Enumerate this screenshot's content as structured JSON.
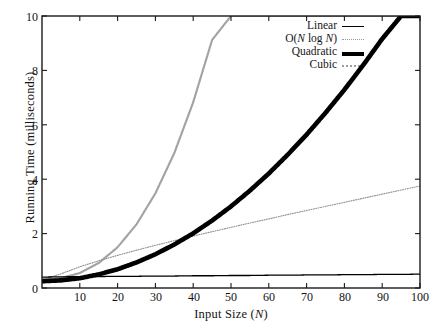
{
  "chart_data": {
    "type": "line",
    "title": "",
    "xlabel": "Input Size (N)",
    "ylabel": "Running Time (milliseconds)",
    "xlim": [
      0,
      100
    ],
    "ylim": [
      0,
      10
    ],
    "grid": false,
    "legend_position": "top-right",
    "xticks": [
      10,
      20,
      30,
      40,
      50,
      60,
      70,
      80,
      90,
      100
    ],
    "yticks": [
      0,
      2,
      4,
      6,
      8,
      10
    ],
    "x": [
      0,
      5,
      10,
      15,
      20,
      25,
      30,
      35,
      40,
      45,
      50,
      55,
      60,
      65,
      70,
      75,
      80,
      85,
      90,
      95,
      100
    ],
    "series": [
      {
        "name": "Linear",
        "legend_label": "Linear",
        "style": "thin-solid-black",
        "color": "#000000",
        "values": [
          0.4,
          0.41,
          0.42,
          0.42,
          0.43,
          0.43,
          0.44,
          0.44,
          0.45,
          0.45,
          0.46,
          0.46,
          0.47,
          0.47,
          0.48,
          0.48,
          0.49,
          0.49,
          0.5,
          0.5,
          0.51
        ]
      },
      {
        "name": "O(N log N)",
        "legend_label": "O(N log N)",
        "style": "fine-dotted-gray",
        "color": "#8c8c8c",
        "values": [
          0.3,
          0.52,
          0.78,
          1.0,
          1.2,
          1.39,
          1.57,
          1.74,
          1.91,
          2.07,
          2.23,
          2.39,
          2.54,
          2.7,
          2.85,
          3.0,
          3.15,
          3.3,
          3.45,
          3.6,
          3.75
        ]
      },
      {
        "name": "Quadratic",
        "legend_label": "Quadratic",
        "style": "thick-solid-black",
        "color": "#000000",
        "values": [
          0.25,
          0.28,
          0.36,
          0.5,
          0.69,
          0.94,
          1.24,
          1.6,
          2.01,
          2.48,
          3.0,
          3.58,
          4.21,
          4.9,
          5.64,
          6.44,
          7.29,
          8.2,
          9.16,
          10.0,
          10.0
        ]
      },
      {
        "name": "Cubic",
        "legend_label": "Cubic",
        "style": "dotted-light-gray",
        "color": "#a0a0a0",
        "values": [
          0.3,
          0.36,
          0.55,
          0.92,
          1.5,
          2.34,
          3.48,
          4.96,
          6.83,
          9.12,
          10.0,
          10.0,
          10.0,
          10.0,
          10.0,
          10.0,
          10.0,
          10.0,
          10.0,
          10.0,
          10.0
        ]
      }
    ],
    "annotations": {
      "nlogn_right_end_value": 6.0,
      "quadratic_reaches_top_at_n": 95,
      "cubic_reaches_top_at_n": 28,
      "quadratic_crosses_nlogn_near_n": 43
    }
  },
  "axis": {
    "x_tick_labels": [
      "10",
      "20",
      "30",
      "40",
      "50",
      "60",
      "70",
      "80",
      "90",
      "100"
    ],
    "y_tick_labels": [
      "0",
      "2",
      "4",
      "6",
      "8",
      "10"
    ]
  },
  "legend": {
    "items": [
      {
        "label": "Linear",
        "sample": "thin-solid-line-icon"
      },
      {
        "label_prefix": "O(",
        "label_italic": "N",
        "label_mid": " log ",
        "label_italic2": "N",
        "label_suffix": ")",
        "sample": "fine-dotted-line-icon"
      },
      {
        "label": "Quadratic",
        "sample": "thick-solid-line-icon"
      },
      {
        "label": "Cubic",
        "sample": "dotted-gray-line-icon"
      }
    ]
  }
}
